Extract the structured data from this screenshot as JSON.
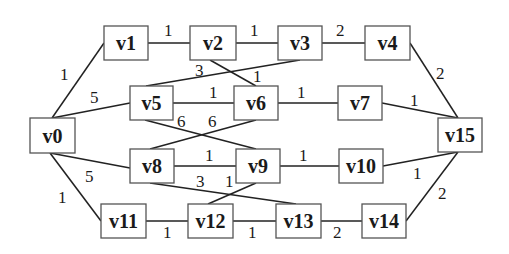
{
  "diagram": {
    "type": "weighted-undirected-graph",
    "nodes": [
      {
        "id": "v0",
        "label": "v0",
        "x": 30,
        "y": 118,
        "w": 45,
        "h": 35
      },
      {
        "id": "v1",
        "label": "v1",
        "x": 104,
        "y": 26,
        "w": 44,
        "h": 34
      },
      {
        "id": "v2",
        "label": "v2",
        "x": 190,
        "y": 26,
        "w": 46,
        "h": 34
      },
      {
        "id": "v3",
        "label": "v3",
        "x": 278,
        "y": 26,
        "w": 44,
        "h": 34
      },
      {
        "id": "v4",
        "label": "v4",
        "x": 365,
        "y": 26,
        "w": 45,
        "h": 34
      },
      {
        "id": "v5",
        "label": "v5",
        "x": 130,
        "y": 86,
        "w": 43,
        "h": 34
      },
      {
        "id": "v6",
        "label": "v6",
        "x": 234,
        "y": 86,
        "w": 44,
        "h": 34
      },
      {
        "id": "v7",
        "label": "v7",
        "x": 338,
        "y": 86,
        "w": 44,
        "h": 34
      },
      {
        "id": "v8",
        "label": "v8",
        "x": 130,
        "y": 149,
        "w": 44,
        "h": 34
      },
      {
        "id": "v9",
        "label": "v9",
        "x": 236,
        "y": 149,
        "w": 44,
        "h": 34
      },
      {
        "id": "v10",
        "label": "v10",
        "x": 339,
        "y": 149,
        "w": 44,
        "h": 34
      },
      {
        "id": "v11",
        "label": "v11",
        "x": 101,
        "y": 204,
        "w": 45,
        "h": 34
      },
      {
        "id": "v12",
        "label": "v12",
        "x": 188,
        "y": 204,
        "w": 45,
        "h": 34
      },
      {
        "id": "v13",
        "label": "v13",
        "x": 276,
        "y": 204,
        "w": 45,
        "h": 34
      },
      {
        "id": "v14",
        "label": "v14",
        "x": 362,
        "y": 204,
        "w": 44,
        "h": 34
      },
      {
        "id": "v15",
        "label": "v15",
        "x": 438,
        "y": 118,
        "w": 44,
        "h": 34
      }
    ],
    "edges": [
      {
        "from": "v0",
        "to": "v1",
        "weight": "1",
        "x1": 52,
        "y1": 118,
        "x2": 104,
        "y2": 43,
        "lx": 60,
        "ly": 80
      },
      {
        "from": "v0",
        "to": "v5",
        "weight": "5",
        "x1": 52,
        "y1": 118,
        "x2": 130,
        "y2": 103,
        "lx": 90,
        "ly": 103
      },
      {
        "from": "v0",
        "to": "v8",
        "weight": "5",
        "x1": 50,
        "y1": 153,
        "x2": 130,
        "y2": 168,
        "lx": 85,
        "ly": 182
      },
      {
        "from": "v0",
        "to": "v11",
        "weight": "1",
        "x1": 50,
        "y1": 153,
        "x2": 101,
        "y2": 221,
        "lx": 58,
        "ly": 203
      },
      {
        "from": "v1",
        "to": "v2",
        "weight": "1",
        "x1": 148,
        "y1": 43,
        "x2": 190,
        "y2": 43,
        "lx": 164,
        "ly": 36
      },
      {
        "from": "v2",
        "to": "v3",
        "weight": "1",
        "x1": 236,
        "y1": 43,
        "x2": 278,
        "y2": 43,
        "lx": 250,
        "ly": 36
      },
      {
        "from": "v3",
        "to": "v4",
        "weight": "2",
        "x1": 322,
        "y1": 43,
        "x2": 365,
        "y2": 43,
        "lx": 336,
        "ly": 36
      },
      {
        "from": "v2",
        "to": "v6",
        "weight": "1",
        "x1": 210,
        "y1": 60,
        "x2": 256,
        "y2": 86,
        "lx": 253,
        "ly": 82
      },
      {
        "from": "v3",
        "to": "v5",
        "weight": "3",
        "x1": 300,
        "y1": 60,
        "x2": 146,
        "y2": 86,
        "lx": 195,
        "ly": 76
      },
      {
        "from": "v5",
        "to": "v6",
        "weight": "1",
        "x1": 173,
        "y1": 103,
        "x2": 234,
        "y2": 103,
        "lx": 209,
        "ly": 98
      },
      {
        "from": "v5",
        "to": "v9",
        "weight": "6",
        "x1": 145,
        "y1": 120,
        "x2": 256,
        "y2": 149,
        "lx": 177,
        "ly": 127
      },
      {
        "from": "v6",
        "to": "v8",
        "weight": "6",
        "x1": 256,
        "y1": 120,
        "x2": 150,
        "y2": 149,
        "lx": 208,
        "ly": 127
      },
      {
        "from": "v6",
        "to": "v7",
        "weight": "1",
        "x1": 278,
        "y1": 103,
        "x2": 338,
        "y2": 103,
        "lx": 297,
        "ly": 98
      },
      {
        "from": "v7",
        "to": "v15",
        "weight": "1",
        "x1": 382,
        "y1": 103,
        "x2": 458,
        "y2": 118,
        "lx": 410,
        "ly": 106
      },
      {
        "from": "v4",
        "to": "v15",
        "weight": "2",
        "x1": 410,
        "y1": 43,
        "x2": 458,
        "y2": 118,
        "lx": 436,
        "ly": 79
      },
      {
        "from": "v8",
        "to": "v9",
        "weight": "1",
        "x1": 174,
        "y1": 166,
        "x2": 236,
        "y2": 166,
        "lx": 205,
        "ly": 161
      },
      {
        "from": "v8",
        "to": "v13",
        "weight": "3",
        "x1": 150,
        "y1": 183,
        "x2": 296,
        "y2": 204,
        "lx": 196,
        "ly": 187
      },
      {
        "from": "v9",
        "to": "v12",
        "weight": "1",
        "x1": 256,
        "y1": 183,
        "x2": 208,
        "y2": 204,
        "lx": 225,
        "ly": 187
      },
      {
        "from": "v9",
        "to": "v10",
        "weight": "1",
        "x1": 280,
        "y1": 166,
        "x2": 339,
        "y2": 166,
        "lx": 299,
        "ly": 161
      },
      {
        "from": "v10",
        "to": "v15",
        "weight": "1",
        "x1": 383,
        "y1": 166,
        "x2": 458,
        "y2": 152,
        "lx": 413,
        "ly": 179
      },
      {
        "from": "v11",
        "to": "v12",
        "weight": "1",
        "x1": 146,
        "y1": 221,
        "x2": 188,
        "y2": 221,
        "lx": 163,
        "ly": 238
      },
      {
        "from": "v12",
        "to": "v13",
        "weight": "1",
        "x1": 233,
        "y1": 221,
        "x2": 276,
        "y2": 221,
        "lx": 248,
        "ly": 238
      },
      {
        "from": "v13",
        "to": "v14",
        "weight": "2",
        "x1": 321,
        "y1": 221,
        "x2": 362,
        "y2": 221,
        "lx": 333,
        "ly": 238
      },
      {
        "from": "v14",
        "to": "v15",
        "weight": "2",
        "x1": 406,
        "y1": 221,
        "x2": 458,
        "y2": 152,
        "lx": 438,
        "ly": 199
      }
    ]
  }
}
